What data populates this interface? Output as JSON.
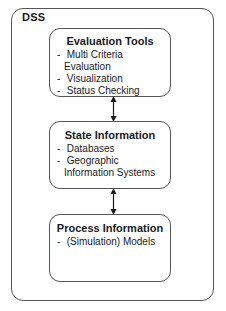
{
  "diagram": {
    "container": {
      "label": "DSS"
    },
    "boxes": [
      {
        "title": "Evaluation Tools",
        "items": [
          "Multi Criteria Evaluation",
          "Visualization",
          "Status Checking"
        ]
      },
      {
        "title": "State Information",
        "items": [
          "Databases",
          "Geographic Information Systems"
        ]
      },
      {
        "title": "Process Information",
        "items": [
          "(Simulation) Models"
        ]
      }
    ],
    "connections": [
      {
        "from": "Evaluation Tools",
        "to": "State Information",
        "type": "bidirectional-arrow"
      },
      {
        "from": "State Information",
        "to": "Process Information",
        "type": "bidirectional-arrow"
      }
    ],
    "bullet": "-"
  },
  "colors": {
    "stroke": "#555555",
    "text": "#1a1a1a",
    "background": "#ffffff"
  }
}
